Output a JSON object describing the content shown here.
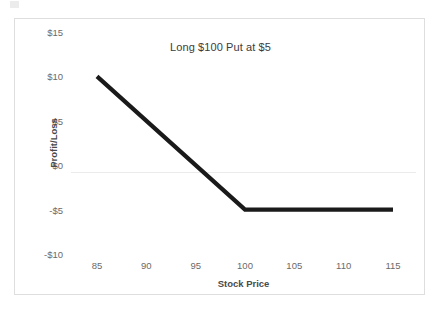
{
  "chart_data": {
    "type": "line",
    "title": "Long $100 Put at $5",
    "xlabel": "Stock Price",
    "ylabel": "Profit/Loss",
    "x": [
      85,
      100,
      115
    ],
    "values": [
      10,
      -5,
      -5
    ],
    "series": [
      {
        "name": "Long $100 Put at $5",
        "x": [
          85,
          100,
          115
        ],
        "values": [
          10,
          -5,
          -5
        ],
        "color": "#1a1a1a"
      }
    ],
    "xlim": [
      85,
      115
    ],
    "ylim": [
      -10,
      15
    ],
    "xticks": [
      85,
      90,
      95,
      100,
      105,
      110,
      115
    ],
    "xtick_labels": [
      "85",
      "90",
      "95",
      "100",
      "105",
      "110",
      "115"
    ],
    "yticks": [
      15,
      10,
      5,
      0,
      -5,
      -10
    ],
    "ytick_labels": [
      "$15",
      "$10",
      "$5",
      "$0",
      "-$5",
      "-$10"
    ],
    "grid": "zero-line-only",
    "legend": "none",
    "annotations": [],
    "colors": {
      "series_line": "#1a1a1a",
      "gridline": "#ebebeb",
      "tick_text": "#6a6a6a",
      "axis_title_text": "#4a4a4a",
      "title_text": "#3b3b3b",
      "frame_border": "#dedede",
      "background": "#ffffff"
    }
  }
}
